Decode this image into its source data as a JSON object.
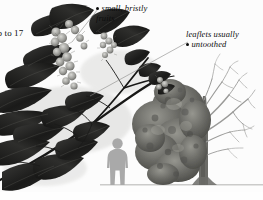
{
  "plate": {
    "kind": "botanical-field-guide-plate",
    "subject": "compound-leaf-with-bristly-fruit-and-tree-habit",
    "background_color": "#fcfcfc",
    "ink_color": "#0d0d0d"
  },
  "labels": {
    "leaflet_count": {
      "text": "up to 17",
      "style": "upright",
      "clipped_at_left_edge": true
    },
    "fruits": {
      "line1": "small, bristly",
      "line2": "fruits",
      "style": "italic",
      "bullet": true
    },
    "untoothed": {
      "line1": "leaflets usually",
      "line2": "untoothed",
      "style": "italic",
      "bullet": true
    }
  },
  "figure": {
    "leaf_color": "#20201f",
    "fruit_color": "#8d8d8a",
    "tree_foliage_color": "#6e6e6c",
    "tree_branch_color": "#9a9a98",
    "human_silhouette_color": "#a9a9a9",
    "ground_line_color": "#8e8e8c",
    "leader_line_color": "#8a8a88"
  }
}
